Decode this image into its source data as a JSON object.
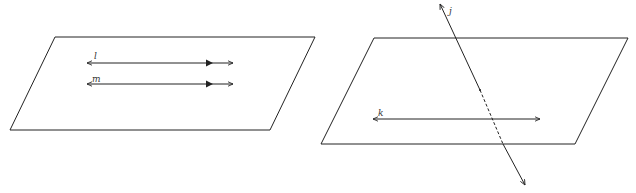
{
  "figures": [
    {
      "id": "parallel-lines",
      "plane": {
        "stroke": "#222222"
      },
      "lines": [
        {
          "label": "l"
        },
        {
          "label": "m"
        }
      ]
    },
    {
      "id": "intersecting-line",
      "plane": {
        "stroke": "#222222"
      },
      "lines": [
        {
          "label": "k"
        },
        {
          "label": "j"
        }
      ]
    }
  ],
  "colors": {
    "stroke": "#222222",
    "label": "#333333",
    "background": "#ffffff"
  }
}
